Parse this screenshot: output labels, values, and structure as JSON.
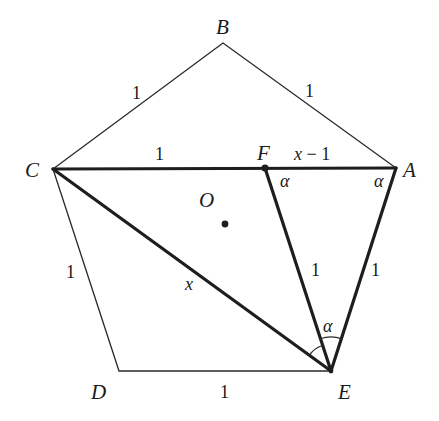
{
  "figure": {
    "colors": {
      "line": "#1e1e1e",
      "background": "#ffffff"
    }
  },
  "vertices": {
    "A": {
      "label": "A",
      "x": 396,
      "y": 168
    },
    "B": {
      "label": "B",
      "x": 223,
      "y": 43
    },
    "C": {
      "label": "C",
      "x": 53,
      "y": 169
    },
    "D": {
      "label": "D",
      "x": 119,
      "y": 371
    },
    "E": {
      "label": "E",
      "x": 331,
      "y": 371
    },
    "F": {
      "label": "F",
      "x": 265,
      "y": 168
    },
    "O": {
      "label": "O",
      "x": 225,
      "y": 224
    }
  },
  "segments": {
    "CB": {
      "label": "1",
      "style": "thin"
    },
    "BA": {
      "label": "1",
      "style": "thin"
    },
    "CD": {
      "label": "1",
      "style": "thin"
    },
    "DE": {
      "label": "1",
      "style": "thin"
    },
    "CF": {
      "label": "1",
      "style": "thick"
    },
    "FA": {
      "label_var": "x",
      "label_rest": " − 1",
      "style": "thick"
    },
    "CE": {
      "label": "x",
      "style": "thick"
    },
    "FE": {
      "label": "1",
      "style": "thick"
    },
    "AE": {
      "label": "1",
      "style": "thick"
    }
  },
  "angles": {
    "at_F": {
      "label": "α"
    },
    "at_A": {
      "label": "α"
    },
    "at_E": {
      "label": "α"
    }
  }
}
